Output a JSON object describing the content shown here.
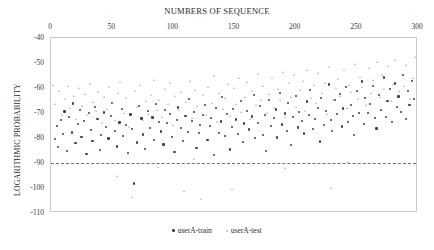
{
  "chart_data": {
    "type": "scatter",
    "title": "NUMBERS OF SEQUENCE",
    "xlabel": "NUMBERS OF SEQUENCE",
    "ylabel": "LOGARITHMIC PROBABILITY",
    "xlim": [
      0,
      300
    ],
    "ylim": [
      -110,
      -40
    ],
    "xticks": [
      0,
      50,
      100,
      150,
      200,
      250,
      300
    ],
    "yticks": [
      -40,
      -50,
      -60,
      -70,
      -80,
      -90,
      -100,
      -110
    ],
    "xaxis_position": "top",
    "grid": false,
    "legend_position": "bottom-center",
    "annotations": [
      {
        "type": "hline",
        "y": -90,
        "style": "dash-dot",
        "color": "#6f6f76"
      }
    ],
    "colors": {
      "train": "#3f3f46",
      "test": "#b3b3bb",
      "threshold": "#6f6f76",
      "frame": "#c9c9c9"
    },
    "series": [
      {
        "name": "userA-train",
        "marker": "circle",
        "color": "#3f3f46",
        "points": [
          [
            3,
            -80.4
          ],
          [
            5,
            -75.1
          ],
          [
            6,
            -83.6
          ],
          [
            8,
            -72.9
          ],
          [
            10,
            -78.3
          ],
          [
            11,
            -69.4
          ],
          [
            13,
            -85.2
          ],
          [
            15,
            -71.6
          ],
          [
            17,
            -77.8
          ],
          [
            18,
            -66.2
          ],
          [
            20,
            -82.1
          ],
          [
            22,
            -74.5
          ],
          [
            24,
            -68.9
          ],
          [
            25,
            -79.7
          ],
          [
            27,
            -73.2
          ],
          [
            29,
            -86.4
          ],
          [
            31,
            -70.1
          ],
          [
            33,
            -76.8
          ],
          [
            34,
            -81.3
          ],
          [
            36,
            -67.5
          ],
          [
            38,
            -72.4
          ],
          [
            40,
            -84.9
          ],
          [
            41,
            -78.9
          ],
          [
            43,
            -69.8
          ],
          [
            45,
            -75.6
          ],
          [
            47,
            -80.2
          ],
          [
            49,
            -71.3
          ],
          [
            50,
            -65.9
          ],
          [
            52,
            -77.1
          ],
          [
            54,
            -83.4
          ],
          [
            56,
            -73.8
          ],
          [
            58,
            -68.4
          ],
          [
            59,
            -79.2
          ],
          [
            61,
            -74.7
          ],
          [
            63,
            -86.1
          ],
          [
            65,
            -70.6
          ],
          [
            66,
            -76.3
          ],
          [
            68,
            -98.2
          ],
          [
            70,
            -81.8
          ],
          [
            72,
            -67.1
          ],
          [
            74,
            -72.2
          ],
          [
            75,
            -78.6
          ],
          [
            77,
            -84.3
          ],
          [
            79,
            -69.2
          ],
          [
            81,
            -75.9
          ],
          [
            83,
            -71.8
          ],
          [
            84,
            -80.7
          ],
          [
            86,
            -66.4
          ],
          [
            88,
            -73.5
          ],
          [
            90,
            -77.4
          ],
          [
            92,
            -82.6
          ],
          [
            93,
            -68.7
          ],
          [
            95,
            -74.1
          ],
          [
            97,
            -70.3
          ],
          [
            99,
            -79.5
          ],
          [
            101,
            -85.7
          ],
          [
            103,
            -72.7
          ],
          [
            104,
            -67.8
          ],
          [
            106,
            -76.1
          ],
          [
            108,
            -81.1
          ],
          [
            110,
            -71.1
          ],
          [
            112,
            -77.6
          ],
          [
            113,
            -64.3
          ],
          [
            115,
            -73.1
          ],
          [
            117,
            -69.5
          ],
          [
            119,
            -83.9
          ],
          [
            121,
            -78.1
          ],
          [
            122,
            -74.9
          ],
          [
            124,
            -70.8
          ],
          [
            126,
            -66.7
          ],
          [
            128,
            -80.9
          ],
          [
            130,
            -75.3
          ],
          [
            131,
            -71.9
          ],
          [
            133,
            -86.8
          ],
          [
            135,
            -68.1
          ],
          [
            137,
            -77.9
          ],
          [
            139,
            -73.4
          ],
          [
            140,
            -63.6
          ],
          [
            142,
            -79.1
          ],
          [
            144,
            -70.4
          ],
          [
            146,
            -84.6
          ],
          [
            148,
            -75.7
          ],
          [
            149,
            -68.3
          ],
          [
            151,
            -72.6
          ],
          [
            153,
            -78.4
          ],
          [
            155,
            -65.1
          ],
          [
            157,
            -81.6
          ],
          [
            158,
            -74.2
          ],
          [
            160,
            -69.1
          ],
          [
            162,
            -76.6
          ],
          [
            164,
            -71.4
          ],
          [
            166,
            -62.8
          ],
          [
            167,
            -80.1
          ],
          [
            169,
            -73.9
          ],
          [
            171,
            -67.3
          ],
          [
            173,
            -78.8
          ],
          [
            175,
            -70.9
          ],
          [
            176,
            -85.1
          ],
          [
            178,
            -64.7
          ],
          [
            180,
            -75.2
          ],
          [
            182,
            -72.1
          ],
          [
            184,
            -68.6
          ],
          [
            185,
            -79.8
          ],
          [
            187,
            -61.9
          ],
          [
            189,
            -74.6
          ],
          [
            191,
            -70.2
          ],
          [
            193,
            -77.2
          ],
          [
            194,
            -66.1
          ],
          [
            196,
            -82.9
          ],
          [
            198,
            -71.7
          ],
          [
            200,
            -63.1
          ],
          [
            202,
            -75.8
          ],
          [
            203,
            -69.7
          ],
          [
            205,
            -73.3
          ],
          [
            207,
            -78.2
          ],
          [
            209,
            -65.4
          ],
          [
            211,
            -70.7
          ],
          [
            212,
            -60.8
          ],
          [
            214,
            -76.4
          ],
          [
            216,
            -72.3
          ],
          [
            218,
            -67.9
          ],
          [
            220,
            -81.4
          ],
          [
            221,
            -63.9
          ],
          [
            223,
            -74.8
          ],
          [
            225,
            -69.3
          ],
          [
            227,
            -58.6
          ],
          [
            229,
            -72.8
          ],
          [
            230,
            -77.3
          ],
          [
            232,
            -64.9
          ],
          [
            234,
            -70.5
          ],
          [
            236,
            -62.4
          ],
          [
            238,
            -75.4
          ],
          [
            239,
            -68.2
          ],
          [
            241,
            -59.7
          ],
          [
            243,
            -73.7
          ],
          [
            245,
            -66.8
          ],
          [
            247,
            -71.2
          ],
          [
            248,
            -78.7
          ],
          [
            250,
            -61.3
          ],
          [
            252,
            -69.9
          ],
          [
            254,
            -57.4
          ],
          [
            256,
            -74.3
          ],
          [
            257,
            -64.1
          ],
          [
            259,
            -70.0
          ],
          [
            261,
            -66.3
          ],
          [
            263,
            -59.1
          ],
          [
            265,
            -72.0
          ],
          [
            266,
            -76.2
          ],
          [
            268,
            -62.7
          ],
          [
            270,
            -68.8
          ],
          [
            272,
            -55.8
          ],
          [
            274,
            -71.5
          ],
          [
            275,
            -65.2
          ],
          [
            277,
            -60.4
          ],
          [
            279,
            -73.6
          ],
          [
            281,
            -58.2
          ],
          [
            283,
            -67.6
          ],
          [
            284,
            -63.4
          ],
          [
            286,
            -69.6
          ],
          [
            288,
            -54.9
          ],
          [
            290,
            -72.5
          ],
          [
            292,
            -61.1
          ],
          [
            293,
            -66.9
          ],
          [
            295,
            -57.1
          ],
          [
            297,
            -64.5
          ],
          [
            299,
            -70.1
          ]
        ]
      },
      {
        "name": "userA-test",
        "marker": "triangle",
        "color": "#b3b3bb",
        "points": [
          [
            2,
            -58.9
          ],
          [
            4,
            -66.4
          ],
          [
            7,
            -61.2
          ],
          [
            9,
            -70.8
          ],
          [
            12,
            -64.6
          ],
          [
            14,
            -59.3
          ],
          [
            16,
            -68.1
          ],
          [
            19,
            -63.2
          ],
          [
            21,
            -72.4
          ],
          [
            23,
            -60.1
          ],
          [
            26,
            -67.3
          ],
          [
            28,
            -62.5
          ],
          [
            30,
            -71.1
          ],
          [
            32,
            -58.4
          ],
          [
            35,
            -65.8
          ],
          [
            37,
            -69.4
          ],
          [
            39,
            -61.7
          ],
          [
            42,
            -74.2
          ],
          [
            44,
            -63.9
          ],
          [
            46,
            -68.6
          ],
          [
            48,
            -59.8
          ],
          [
            51,
            -66.1
          ],
          [
            53,
            -72.9
          ],
          [
            55,
            -62.1
          ],
          [
            57,
            -57.6
          ],
          [
            60,
            -70.3
          ],
          [
            62,
            -64.2
          ],
          [
            64,
            -75.6
          ],
          [
            67,
            -103.8
          ],
          [
            69,
            -61.4
          ],
          [
            71,
            -67.8
          ],
          [
            73,
            -59.1
          ],
          [
            76,
            -73.1
          ],
          [
            78,
            -65.3
          ],
          [
            80,
            -70.6
          ],
          [
            82,
            -62.9
          ],
          [
            85,
            -56.8
          ],
          [
            87,
            -68.9
          ],
          [
            89,
            -64.8
          ],
          [
            91,
            -71.7
          ],
          [
            94,
            -60.6
          ],
          [
            96,
            -66.7
          ],
          [
            98,
            -58.1
          ],
          [
            100,
            -74.8
          ],
          [
            102,
            -63.5
          ],
          [
            105,
            -69.1
          ],
          [
            107,
            -61.8
          ],
          [
            109,
            -101.4
          ],
          [
            111,
            -65.6
          ],
          [
            114,
            -57.2
          ],
          [
            116,
            -72.1
          ],
          [
            118,
            -60.9
          ],
          [
            120,
            -67.2
          ],
          [
            123,
            -104.6
          ],
          [
            125,
            -63.1
          ],
          [
            127,
            -70.9
          ],
          [
            129,
            -59.6
          ],
          [
            132,
            -66.0
          ],
          [
            134,
            -55.4
          ],
          [
            136,
            -73.8
          ],
          [
            138,
            -62.2
          ],
          [
            141,
            -68.4
          ],
          [
            143,
            -64.3
          ],
          [
            145,
            -58.7
          ],
          [
            147,
            -71.3
          ],
          [
            150,
            -60.2
          ],
          [
            152,
            -66.6
          ],
          [
            154,
            -56.1
          ],
          [
            156,
            -69.8
          ],
          [
            159,
            -63.7
          ],
          [
            161,
            -57.9
          ],
          [
            163,
            -72.6
          ],
          [
            165,
            -61.5
          ],
          [
            168,
            -67.0
          ],
          [
            170,
            -54.6
          ],
          [
            172,
            -64.9
          ],
          [
            174,
            -59.4
          ],
          [
            177,
            -70.2
          ],
          [
            179,
            -62.6
          ],
          [
            181,
            -56.3
          ],
          [
            183,
            -68.2
          ],
          [
            186,
            -60.7
          ],
          [
            188,
            -65.1
          ],
          [
            190,
            -53.8
          ],
          [
            192,
            -71.9
          ],
          [
            195,
            -58.3
          ],
          [
            197,
            -63.8
          ],
          [
            199,
            -55.1
          ],
          [
            201,
            -67.7
          ],
          [
            204,
            -61.0
          ],
          [
            206,
            -57.5
          ],
          [
            208,
            -69.2
          ],
          [
            210,
            -52.9
          ],
          [
            213,
            -64.0
          ],
          [
            215,
            -59.0
          ],
          [
            217,
            -66.3
          ],
          [
            219,
            -54.2
          ],
          [
            222,
            -62.3
          ],
          [
            224,
            -58.0
          ],
          [
            226,
            -70.4
          ],
          [
            228,
            -51.7
          ],
          [
            231,
            -65.0
          ],
          [
            233,
            -60.3
          ],
          [
            235,
            -56.6
          ],
          [
            237,
            -63.3
          ],
          [
            240,
            -53.1
          ],
          [
            242,
            -68.0
          ],
          [
            244,
            -58.8
          ],
          [
            246,
            -61.6
          ],
          [
            249,
            -50.4
          ],
          [
            251,
            -64.4
          ],
          [
            253,
            -55.7
          ],
          [
            255,
            -59.9
          ],
          [
            258,
            -66.8
          ],
          [
            260,
            -52.3
          ],
          [
            262,
            -62.0
          ],
          [
            264,
            -57.0
          ],
          [
            267,
            -49.6
          ],
          [
            269,
            -63.6
          ],
          [
            271,
            -55.0
          ],
          [
            273,
            -60.5
          ],
          [
            276,
            -51.2
          ],
          [
            278,
            -65.5
          ],
          [
            280,
            -58.5
          ],
          [
            282,
            -48.8
          ],
          [
            285,
            -61.3
          ],
          [
            287,
            -54.4
          ],
          [
            289,
            -59.2
          ],
          [
            291,
            -50.9
          ],
          [
            294,
            -64.7
          ],
          [
            296,
            -56.2
          ],
          [
            298,
            -47.9
          ],
          [
            300,
            -60.0
          ],
          [
            54,
            -95.2
          ],
          [
            148,
            -100.6
          ],
          [
            192,
            -92.1
          ],
          [
            229,
            -100.2
          ],
          [
            117,
            -88.4
          ],
          [
            88,
            -91.6
          ],
          [
            243,
            -89.8
          ]
        ]
      }
    ]
  }
}
